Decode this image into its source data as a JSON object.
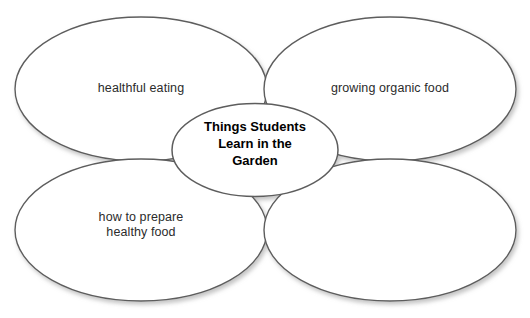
{
  "canvas": {
    "width": 530,
    "height": 318,
    "background": "#ffffff"
  },
  "style": {
    "ellipse_stroke": "#5d5d5d",
    "ellipse_fill": "#ffffff",
    "label_color": "#2b2b2b",
    "center_label_color": "#000000",
    "shadow_color": "#b9b9b9"
  },
  "diagram": {
    "type": "cluster-web",
    "center": {
      "label": "Things Students\nLearn in the\nGarden",
      "shape": "ellipse",
      "cx": 255,
      "cy": 150,
      "rx": 83,
      "ry": 46.5
    },
    "branches": [
      {
        "id": "top-left",
        "label": "healthful eating",
        "shape": "ellipse",
        "cx": 141,
        "cy": 89,
        "rx": 126,
        "ry": 72
      },
      {
        "id": "top-right",
        "label": "growing organic food",
        "shape": "ellipse",
        "cx": 390,
        "cy": 89,
        "rx": 126,
        "ry": 72
      },
      {
        "id": "bottom-left",
        "label": "how to prepare\nhealthy food",
        "shape": "ellipse",
        "cx": 141,
        "cy": 230,
        "rx": 126,
        "ry": 71
      },
      {
        "id": "bottom-right",
        "label": "",
        "shape": "ellipse",
        "cx": 390,
        "cy": 230,
        "rx": 126,
        "ry": 71
      }
    ]
  }
}
